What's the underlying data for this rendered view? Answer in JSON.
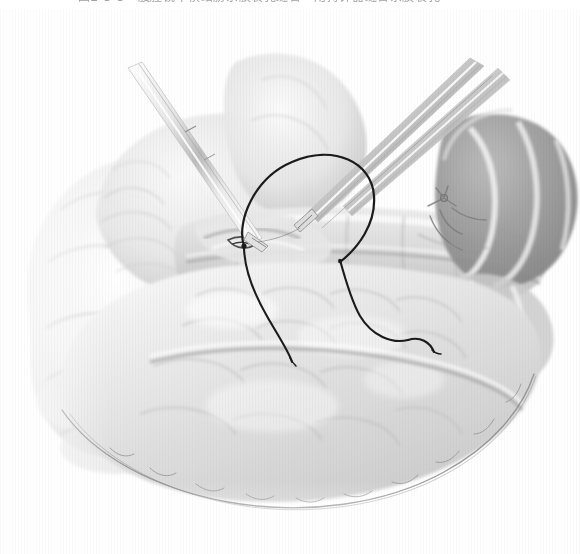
{
  "page": {
    "background_color": "#ffffff",
    "width": 580,
    "height": 554
  },
  "caption": {
    "text": "图2-3-5　腹腔镜下横结肠系膜裂孔缝合　用持针器缝合系膜裂孔",
    "color": "#8e8e94",
    "note": "clipped-at-top-edge"
  },
  "figure": {
    "name": "laparoscopic-mesenteric-defect-suture-illustration",
    "style": "grayscale-pencil-medical-illustration",
    "palette": {
      "paper": "#ffffff",
      "tissue_light": "#f2f2f2",
      "tissue_mid": "#d7d7d7",
      "tissue_dark": "#a8a8a8",
      "haustra_dark": "#8b8b8b",
      "suture": "#1b1b1b",
      "instrument_steel": "#cfcfcf",
      "outline": "#6f6f6f"
    },
    "elements": [
      {
        "name": "instrument-left-grasper",
        "label": "laparoscopic grasper (upper-left)"
      },
      {
        "name": "instrument-right-needle-holder",
        "label": "needle holder (upper-right)"
      },
      {
        "name": "instrument-right-second-shaft",
        "label": "second instrument shaft (upper-right)"
      },
      {
        "name": "suture-loop",
        "label": "suture thread loop"
      },
      {
        "name": "suture-tail-left",
        "label": "suture thread tail (left)"
      },
      {
        "name": "suture-tail-right",
        "label": "suture thread tail (right)"
      },
      {
        "name": "transverse-colon",
        "label": "transverse colon"
      },
      {
        "name": "colon-haustra-right",
        "label": "colonic haustra (right)"
      },
      {
        "name": "greater-omentum",
        "label": "greater omentum"
      },
      {
        "name": "mesenteric-defect",
        "label": "mesenteric defect / hiatus"
      },
      {
        "name": "mesenteric-vessels",
        "label": "mesenteric vessels"
      },
      {
        "name": "small-bowel-mass-left",
        "label": "small bowel / viscera (left)"
      },
      {
        "name": "omental-lower-border",
        "label": "lower omental fringe border"
      }
    ]
  }
}
